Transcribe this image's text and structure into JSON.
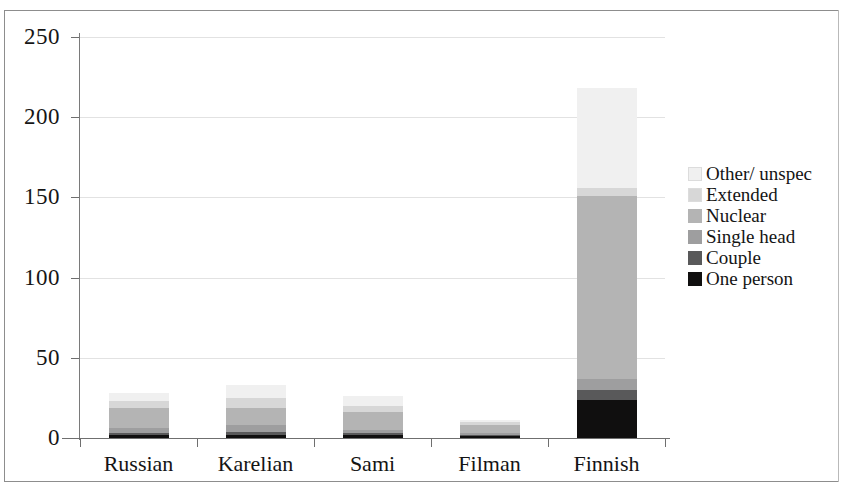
{
  "chart_data": {
    "type": "bar",
    "subtype": "stacked",
    "title": "",
    "subtitle": "",
    "xlabel": "",
    "ylabel": "",
    "ylim": [
      0,
      250
    ],
    "yticks": [
      0,
      50,
      100,
      150,
      200,
      250
    ],
    "ytick_labels": [
      "0",
      "50",
      "100",
      "150",
      "200",
      "250"
    ],
    "grid": true,
    "grid_axis": "y",
    "legend_position": "right",
    "categories": [
      "Russian",
      "Karelian",
      "Sami",
      "Filman",
      "Finnish"
    ],
    "series": [
      {
        "name": "One person",
        "color": "#100f0f",
        "values": [
          2,
          2,
          2,
          1,
          24
        ]
      },
      {
        "name": "Couple",
        "color": "#59595a",
        "values": [
          1,
          2,
          1,
          1,
          6
        ]
      },
      {
        "name": "Single head",
        "color": "#9e9e9f",
        "values": [
          3,
          4,
          2,
          1,
          7
        ]
      },
      {
        "name": "Nuclear",
        "color": "#b4b4b4",
        "values": [
          13,
          11,
          11,
          5,
          114
        ]
      },
      {
        "name": "Extended",
        "color": "#d7d7d7",
        "values": [
          4,
          6,
          4,
          2,
          5
        ]
      },
      {
        "name": "Other/ unspec",
        "color": "#f0f0f0",
        "values": [
          5,
          8,
          6,
          1,
          62
        ]
      }
    ],
    "totals": [
      28,
      33,
      26,
      11,
      218
    ],
    "legend": [
      {
        "label": "Other/ unspec",
        "color": "#f0f0f0"
      },
      {
        "label": "Extended",
        "color": "#d7d7d7"
      },
      {
        "label": "Nuclear",
        "color": "#b4b4b4"
      },
      {
        "label": "Single head",
        "color": "#9e9e9f"
      },
      {
        "label": "Couple",
        "color": "#59595a"
      },
      {
        "label": "One person",
        "color": "#100f0f"
      }
    ]
  }
}
